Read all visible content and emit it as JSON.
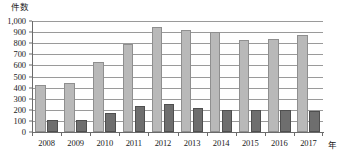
{
  "chart_data": {
    "type": "bar",
    "title": "",
    "subtitle": "",
    "xlabel": "年",
    "ylabel": "件数",
    "ylim": [
      0,
      1000
    ],
    "ytick_step": 100,
    "grid": true,
    "legend": "none",
    "orientation": "vertical",
    "grouping": "grouped",
    "categories": [
      "2008",
      "2009",
      "2010",
      "2011",
      "2012",
      "2013",
      "2014",
      "2015",
      "2016",
      "2017"
    ],
    "ytick_labels": [
      "1,000",
      "900",
      "800",
      "700",
      "600",
      "500",
      "400",
      "300",
      "200",
      "100",
      "0"
    ],
    "ytick_values": [
      1000,
      900,
      800,
      700,
      600,
      500,
      400,
      300,
      200,
      100,
      0
    ],
    "series": [
      {
        "name": "series-light",
        "color": "#b9b9b9",
        "edge_color": "#8f8f8f",
        "values": [
          425,
          440,
          630,
          795,
          945,
          920,
          900,
          830,
          835,
          875
        ]
      },
      {
        "name": "series-dark",
        "color": "#6e6e6e",
        "edge_color": "#4f4f4f",
        "values": [
          110,
          110,
          175,
          235,
          255,
          215,
          195,
          195,
          195,
          190
        ]
      }
    ],
    "annotations": [],
    "colors": {
      "gridline": "#9a9a9a",
      "axis": "#6b6b6b",
      "text": "#1a1a1a",
      "background": "#ffffff"
    }
  }
}
